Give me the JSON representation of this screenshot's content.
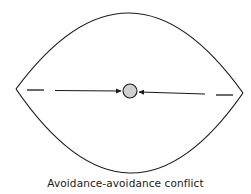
{
  "diagram": {
    "caption": "Avoidance-avoidance conflict",
    "elements": {
      "boundary": "lens-shaped region (two opposing arcs)",
      "center_point": "gray circle",
      "left_arrow": "arrow pointing right toward center",
      "right_arrow": "arrow pointing left toward center",
      "left_dash": "dashed line segment",
      "right_dash": "dashed line segment"
    },
    "colors": {
      "stroke": "#1a1a1a",
      "circle_fill": "#d0d0d0",
      "background": "#ffffff"
    }
  }
}
